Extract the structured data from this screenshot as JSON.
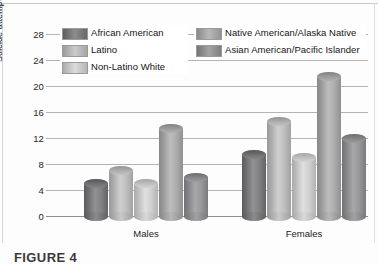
{
  "figure": {
    "caption": "FIGURE 4"
  },
  "chart_data": {
    "type": "bar",
    "title": "",
    "xlabel": "",
    "ylabel": "Suicide attempt rates (per 100)",
    "categories": [
      "Males",
      "Females"
    ],
    "ylim": [
      0,
      28
    ],
    "yticks": [
      0,
      4,
      8,
      12,
      16,
      20,
      24,
      28
    ],
    "ytick_labels": [
      "0",
      "4",
      "8",
      "12",
      "16",
      "20",
      "24",
      "28"
    ],
    "grid": true,
    "legend_position": "top-left-inside",
    "series": [
      {
        "name": "African American",
        "values": [
          5,
          9.5
        ],
        "color": "#77777a"
      },
      {
        "name": "Latino",
        "values": [
          7,
          14.5
        ],
        "color": "#b5b5b5"
      },
      {
        "name": "Non-Latino White",
        "values": [
          5,
          9
        ],
        "color": "#c6c6c6"
      },
      {
        "name": "Native American/Alaska Native",
        "values": [
          13.5,
          21.5
        ],
        "color": "#a3a3a3"
      },
      {
        "name": "Asian American/Pacific Islander",
        "values": [
          6,
          12
        ],
        "color": "#8e8e90"
      }
    ]
  },
  "axis": {
    "y_title": "Suicide attempt rates (per 100)",
    "x_group_1": "Males",
    "x_group_2": "Females"
  },
  "legend": {
    "items": [
      {
        "label": "African American"
      },
      {
        "label": "Latino"
      },
      {
        "label": "Non-Latino White"
      },
      {
        "label": "Native American/Alaska Native"
      },
      {
        "label": "Asian American/Pacific Islander"
      }
    ]
  }
}
